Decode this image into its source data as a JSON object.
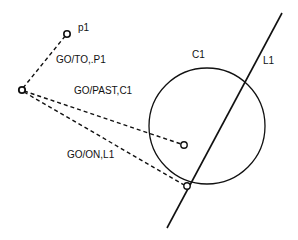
{
  "diagram": {
    "labels": {
      "p1": "p1",
      "go_to": "GO/TO,.P1",
      "go_past": "GO/PAST,C1",
      "go_on": "GO/ON,L1",
      "c1": "C1",
      "l1": "L1"
    },
    "colors": {
      "stroke": "#111111",
      "background": "#ffffff"
    }
  }
}
